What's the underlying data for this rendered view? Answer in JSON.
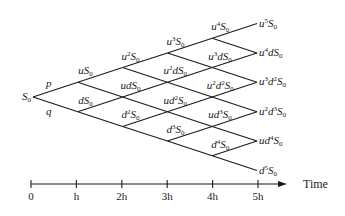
{
  "diagram": {
    "type": "binomial-tree",
    "steps": 5,
    "colors": {
      "line": "#1a1a1a",
      "background": "#ffffff"
    },
    "probabilities": {
      "up": "p",
      "down": "q"
    },
    "root": {
      "label": "S0"
    },
    "levels": [
      [
        {
          "label_html": "S<sub>0</sub>"
        }
      ],
      [
        {
          "label_html": "dS<sub>0</sub>"
        },
        {
          "label_html": "uS<sub>0</sub>"
        }
      ],
      [
        {
          "label_html": "d<sup>2</sup>S<sub>0</sub>"
        },
        {
          "label_html": "udS<sub>0</sub>"
        },
        {
          "label_html": "u<sup>2</sup>S<sub>0</sub>"
        }
      ],
      [
        {
          "label_html": "d<sup>3</sup>S<sub>0</sub>"
        },
        {
          "label_html": "ud<sup>2</sup>S<sub>0</sub>"
        },
        {
          "label_html": "u<sup>2</sup>dS<sub>0</sub>"
        },
        {
          "label_html": "u<sup>3</sup>S<sub>0</sub>"
        }
      ],
      [
        {
          "label_html": "d<sup>4</sup>S<sub>0</sub>"
        },
        {
          "label_html": "ud<sup>3</sup>S<sub>0</sub>"
        },
        {
          "label_html": "u<sup>2</sup>d<sup>2</sup>S<sub>0</sub>"
        },
        {
          "label_html": "u<sup>3</sup>dS<sub>0</sub>"
        },
        {
          "label_html": "u<sup>4</sup>S<sub>0</sub>"
        }
      ],
      [
        {
          "label_html": "d<sup>5</sup>S<sub>0</sub>"
        },
        {
          "label_html": "ud<sup>4</sup>S<sub>0</sub>"
        },
        {
          "label_html": "u<sup>2</sup>d<sup>3</sup>S<sub>0</sub>"
        },
        {
          "label_html": "u<sup>3</sup>d<sup>2</sup>S<sub>0</sub>"
        },
        {
          "label_html": "u<sup>4</sup>dS<sub>0</sub>"
        },
        {
          "label_html": "u<sup>5</sup>S<sub>0</sub>"
        }
      ]
    ],
    "node_text": {
      "S0": "S0",
      "uS0": "uS0",
      "dS0": "dS0",
      "u2S0": "u2S0",
      "udS0": "udS0",
      "d2S0": "d2S0",
      "u3S0": "u3S0",
      "u2dS0": "u2dS0",
      "ud2S0": "ud2S0",
      "d3S0": "d3S0",
      "u4S0": "u4S0",
      "u3dS0": "u3dS0",
      "u2d2S0": "u2d2S0",
      "ud3S0": "ud3S0",
      "d4S0": "d4S0",
      "u5S0": "u5S0",
      "u4dS0": "u4dS0",
      "u3d2S0": "u3d2S0",
      "u2d3S0": "u2d3S0",
      "ud4S0": "ud4S0",
      "d5S0": "d5S0"
    }
  },
  "time_axis": {
    "title": "Time",
    "ticks": [
      "0",
      "h",
      "2h",
      "3h",
      "4h",
      "5h"
    ]
  }
}
